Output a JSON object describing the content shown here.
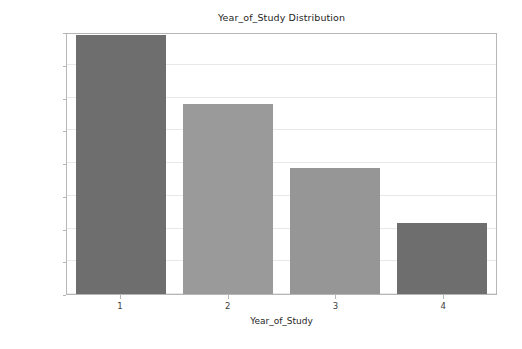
{
  "chart_data": {
    "type": "bar",
    "title": "Year_of_Study Distribution",
    "xlabel": "Year_of_Study",
    "ylabel": "count",
    "categories": [
      "1",
      "2",
      "3",
      "4"
    ],
    "values": [
      198,
      145,
      96,
      54
    ],
    "series": [
      {
        "name": "count",
        "values": [
          198,
          145,
          96,
          54
        ]
      }
    ],
    "ylim": [
      0,
      200
    ],
    "yticks": [
      0,
      25,
      50,
      75,
      100,
      125,
      150,
      175,
      200
    ],
    "ytick_labels": [
      "0",
      "25",
      "50",
      "75",
      "100",
      "125",
      "150",
      "175",
      "200"
    ],
    "xticks": [
      "1",
      "2",
      "3",
      "4"
    ],
    "grid": "horizontal",
    "legend": "none",
    "bar_colors": [
      "#6e6e6e",
      "#9a9a9a",
      "#969696",
      "#6e6e6e"
    ],
    "grid_color": "#e8e8e8",
    "axis_color": "#b6b6b6",
    "background": "#ffffff"
  }
}
